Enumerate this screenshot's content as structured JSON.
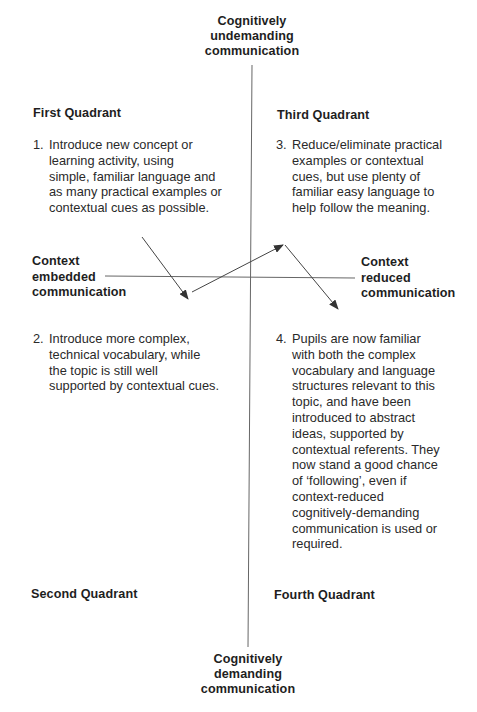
{
  "diagram": {
    "axes": {
      "top_label": [
        "Cognitively",
        "undemanding",
        "communication"
      ],
      "bottom_label": [
        "Cognitively",
        "demanding",
        "communication"
      ],
      "left_label": [
        "Context",
        "embedded",
        "communication"
      ],
      "right_label": [
        "Context",
        "reduced",
        "communication"
      ]
    },
    "quadrants": [
      {
        "id": "first",
        "title": "First Quadrant",
        "position": "top-left"
      },
      {
        "id": "second",
        "title": "Second Quadrant",
        "position": "bottom-left"
      },
      {
        "id": "third",
        "title": "Third Quadrant",
        "position": "top-right"
      },
      {
        "id": "fourth",
        "title": "Fourth Quadrant",
        "position": "bottom-right"
      }
    ],
    "steps": [
      {
        "number": "1.",
        "quadrant": "first",
        "text": [
          "Introduce new concept or",
          "learning activity, using",
          "simple, familiar language and",
          "as many practical examples or",
          "contextual cues as possible."
        ]
      },
      {
        "number": "2.",
        "quadrant": "second",
        "text": [
          "Introduce more complex,",
          "technical vocabulary, while",
          "the topic is still well",
          "supported by contextual cues."
        ]
      },
      {
        "number": "3.",
        "quadrant": "third",
        "text": [
          "Reduce/eliminate practical",
          "examples or contextual",
          "cues, but use plenty of",
          "familiar easy language to",
          "help follow the meaning."
        ]
      },
      {
        "number": "4.",
        "quadrant": "fourth",
        "text": [
          "Pupils are now familiar",
          "with both the complex",
          "vocabulary and language",
          "structures relevant to this",
          "topic, and have been",
          "introduced to abstract",
          "ideas, supported by",
          "contextual referents. They",
          "now stand a good chance",
          "of ‘following’, even if",
          "context-reduced",
          "cognitively-demanding",
          "communication is used or",
          "required."
        ]
      }
    ],
    "arrows": [
      {
        "from": "quadrant-1",
        "to": "quadrant-2",
        "x1": 142,
        "y1": 237,
        "x2": 188,
        "y2": 299
      },
      {
        "from": "quadrant-2",
        "to": "quadrant-3",
        "x1": 192,
        "y1": 292,
        "x2": 283,
        "y2": 245
      },
      {
        "from": "quadrant-3",
        "to": "quadrant-4",
        "x1": 285,
        "y1": 245,
        "x2": 338,
        "y2": 309
      }
    ],
    "colors": {
      "line": "#555555",
      "text": "#1e1e1e",
      "background": "#ffffff"
    }
  }
}
